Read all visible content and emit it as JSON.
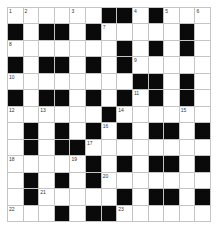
{
  "puzzle": {
    "rows": 13,
    "cols": 13,
    "colors": {
      "black_square": "#0a0a0a",
      "white_square": "#ffffff",
      "gridline": "#c4c4c4",
      "number_text": "#333333"
    },
    "grid": [
      "WWWWWWBBWBWWW",
      "BWBBWBWWWWWBW",
      "WWWWWWWBWBWBW",
      "BWBBWBWBWWWWW",
      "WWWWWWWWBBWBW",
      "BWBBWBWBWBWBW",
      "WWWWWWBWWWWWW",
      "WBWBWBWBWBBWB",
      "WBWBBWWWWWWWW",
      "WWWWWBWBWBBWB",
      "WBWBWBWWWWWWW",
      "WBWWWWWBWBBWB",
      "WWWBWBBWWWWWW"
    ],
    "numbers": [
      {
        "row": 0,
        "col": 0,
        "label": "1"
      },
      {
        "row": 0,
        "col": 1,
        "label": "2"
      },
      {
        "row": 0,
        "col": 4,
        "label": "3"
      },
      {
        "row": 0,
        "col": 8,
        "label": "4"
      },
      {
        "row": 0,
        "col": 10,
        "label": "5"
      },
      {
        "row": 0,
        "col": 12,
        "label": "6"
      },
      {
        "row": 1,
        "col": 6,
        "label": "7"
      },
      {
        "row": 2,
        "col": 0,
        "label": "8"
      },
      {
        "row": 3,
        "col": 8,
        "label": "9"
      },
      {
        "row": 4,
        "col": 0,
        "label": "10"
      },
      {
        "row": 5,
        "col": 8,
        "label": "11"
      },
      {
        "row": 6,
        "col": 0,
        "label": "12"
      },
      {
        "row": 6,
        "col": 2,
        "label": "13"
      },
      {
        "row": 6,
        "col": 7,
        "label": "14"
      },
      {
        "row": 6,
        "col": 11,
        "label": "15"
      },
      {
        "row": 7,
        "col": 6,
        "label": "16"
      },
      {
        "row": 8,
        "col": 5,
        "label": "17"
      },
      {
        "row": 9,
        "col": 0,
        "label": "18"
      },
      {
        "row": 9,
        "col": 4,
        "label": "19"
      },
      {
        "row": 10,
        "col": 6,
        "label": "20"
      },
      {
        "row": 11,
        "col": 2,
        "label": "21"
      },
      {
        "row": 12,
        "col": 0,
        "label": "22"
      },
      {
        "row": 12,
        "col": 7,
        "label": "23"
      }
    ],
    "entries": {}
  }
}
